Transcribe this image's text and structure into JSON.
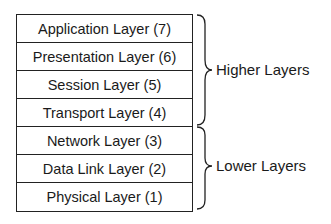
{
  "layers": [
    {
      "name": "Application Layer (7)"
    },
    {
      "name": "Presentation Layer (6)"
    },
    {
      "name": "Session Layer (5)"
    },
    {
      "name": "Transport Layer (4)"
    },
    {
      "name": "Network Layer (3)"
    },
    {
      "name": "Data Link Layer (2)"
    },
    {
      "name": "Physical Layer (1)"
    }
  ],
  "groups": {
    "higher": {
      "label": "Higher Layers",
      "layers": [
        7,
        6,
        5,
        4
      ]
    },
    "lower": {
      "label": "Lower Layers",
      "layers": [
        3,
        2,
        1
      ]
    }
  },
  "colors": {
    "line": "#222222",
    "text": "#1a1a1a",
    "background": "#ffffff"
  }
}
